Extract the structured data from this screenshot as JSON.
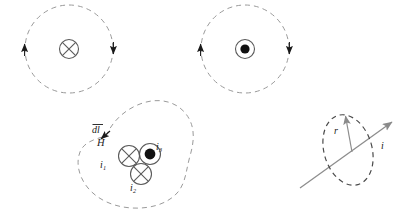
{
  "figure": {
    "canvas": {
      "width": 406,
      "height": 224
    },
    "colors": {
      "dashed_stroke": "#9a9a9a",
      "solid_stroke": "#8d8d8d",
      "symbol_stroke": "#555555",
      "arrow_fill": "#1a1a1a",
      "ink": "#1a1a1a",
      "background": "#ffffff"
    },
    "panels": [
      {
        "id": "panel-into-page",
        "type": "field-line-circle",
        "center": [
          69,
          49
        ],
        "radius": 44,
        "current_symbol": "cross-in-circle",
        "current_direction": "into-page",
        "circulation": "clockwise",
        "arrows": [
          {
            "position": "left",
            "direction": "up"
          },
          {
            "position": "right",
            "direction": "down"
          }
        ]
      },
      {
        "id": "panel-out-of-page",
        "type": "field-line-circle",
        "center": [
          245,
          49
        ],
        "radius": 44,
        "current_symbol": "dot-in-circle",
        "current_direction": "out-of-page",
        "circulation": "clockwise",
        "arrows": [
          {
            "position": "left",
            "direction": "up"
          },
          {
            "position": "right",
            "direction": "down"
          }
        ]
      },
      {
        "id": "panel-amperian-loop",
        "type": "irregular-closed-contour",
        "contour_style": "dashed",
        "enclosed_currents": [
          {
            "label": "i",
            "subscript": "1",
            "symbol": "cross-in-circle",
            "direction": "into-page",
            "center": [
              129,
              156
            ]
          },
          {
            "label": "i",
            "subscript": "2",
            "symbol": "cross-in-circle",
            "direction": "into-page",
            "center": [
              141,
              174
            ]
          },
          {
            "label": "i",
            "subscript": "3",
            "symbol": "dot-in-circle",
            "direction": "out-of-page",
            "center": [
              150,
              154
            ]
          }
        ],
        "annotations": [
          {
            "name": "dl-label",
            "text": "dl",
            "overbar": true
          },
          {
            "name": "H-label",
            "text": "H"
          }
        ],
        "path_arrow": {
          "position": "upper-left",
          "direction": "down-left"
        }
      },
      {
        "id": "panel-wire-loop",
        "type": "tilted-loop-around-wire",
        "loop_style": "dashed",
        "loop_center": [
          348,
          150
        ],
        "loop_rx": 24,
        "loop_ry": 36,
        "loop_rotation_deg": -16,
        "wire": {
          "from": [
            300,
            188
          ],
          "to": [
            394,
            121
          ],
          "arrow_at": "end"
        },
        "radius_vector": {
          "from": [
            352,
            152
          ],
          "to": [
            345,
            113
          ],
          "arrow_at": "end"
        },
        "labels": [
          {
            "name": "radius-label",
            "text": "r"
          },
          {
            "name": "current-label",
            "text": "i"
          }
        ]
      }
    ],
    "labels": {
      "dl": "dl",
      "H": "H",
      "i1": "i",
      "i1_sub": "1",
      "i2": "i",
      "i2_sub": "2",
      "i3": "i",
      "i3_sub": "3",
      "r": "r",
      "i": "i"
    }
  }
}
